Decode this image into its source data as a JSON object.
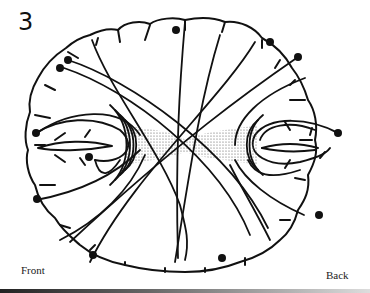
{
  "figure": {
    "number": "3",
    "labels": {
      "front": "Front",
      "back": "Back"
    },
    "colors": {
      "line": "#111111",
      "stipple": "#555555",
      "background": "#ffffff"
    }
  }
}
